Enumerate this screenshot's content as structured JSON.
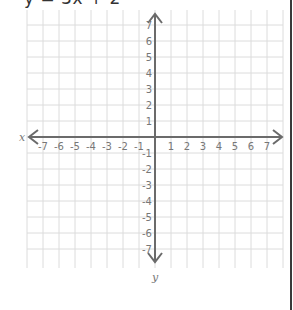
{
  "header": {
    "equation": "y = 3x + 2"
  },
  "chart_data": {
    "type": "coordinate-plane",
    "title": "y = 3x + 2",
    "xlabel": "x",
    "ylabel": "y",
    "xlim": [
      -7,
      7
    ],
    "ylim": [
      -7,
      7
    ],
    "grid": true,
    "x_ticks": [
      "-7",
      "-6",
      "-5",
      "-4",
      "-3",
      "-2",
      "-1",
      "1",
      "2",
      "3",
      "4",
      "5",
      "6",
      "7"
    ],
    "y_ticks": [
      "7",
      "6",
      "5",
      "4",
      "3",
      "2",
      "1",
      "-1",
      "-2",
      "-3",
      "-4",
      "-5",
      "-6",
      "-7"
    ],
    "series": []
  },
  "colors": {
    "grid": "#dcdcdc",
    "axis": "#6b6b6b",
    "label": "#777777",
    "border": "#3a3a3a"
  }
}
